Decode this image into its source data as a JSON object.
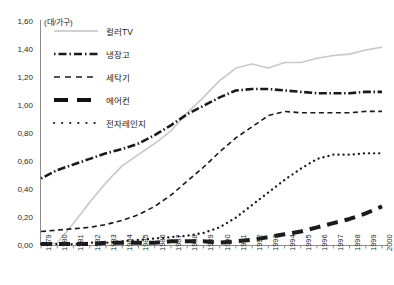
{
  "chart_data": {
    "type": "line",
    "title": "",
    "subtitle": "",
    "unit_label": "(대/가구)",
    "xlabel": "",
    "ylabel": "",
    "ylim": [
      0.0,
      1.6
    ],
    "ytick_labels": [
      "0,00",
      "0,20",
      "0,40",
      "0,60",
      "0,80",
      "1,00",
      "1,20",
      "1,40",
      "1,60"
    ],
    "ytick_values": [
      0.0,
      0.2,
      0.4,
      0.6,
      0.8,
      1.0,
      1.2,
      1.4,
      1.6
    ],
    "grid": false,
    "legend_position": "upper-left",
    "categories": [
      "1979",
      "1980",
      "1981",
      "1982",
      "1983",
      "1984",
      "1985",
      "1986",
      "1987",
      "1988",
      "1989",
      "1990",
      "1991",
      "1992",
      "1993",
      "1994",
      "1995",
      "1996",
      "1997",
      "1998",
      "1999",
      "2000"
    ],
    "series": [
      {
        "name": "컬러TV",
        "style": "solid",
        "color": "#c8c8c8",
        "values": [
          0.0,
          0.02,
          0.16,
          0.31,
          0.45,
          0.57,
          0.65,
          0.73,
          0.82,
          0.95,
          1.06,
          1.18,
          1.27,
          1.3,
          1.27,
          1.31,
          1.31,
          1.34,
          1.36,
          1.37,
          1.4,
          1.42
        ]
      },
      {
        "name": "냉장고",
        "style": "dash-dot",
        "color": "#1a1a1a",
        "values": [
          0.48,
          0.54,
          0.58,
          0.62,
          0.66,
          0.69,
          0.73,
          0.79,
          0.86,
          0.94,
          1.0,
          1.06,
          1.11,
          1.12,
          1.12,
          1.11,
          1.1,
          1.09,
          1.09,
          1.09,
          1.1,
          1.1
        ]
      },
      {
        "name": "세탁기",
        "style": "dashed",
        "color": "#1a1a1a",
        "values": [
          0.1,
          0.11,
          0.12,
          0.13,
          0.15,
          0.18,
          0.22,
          0.28,
          0.36,
          0.46,
          0.56,
          0.67,
          0.77,
          0.85,
          0.93,
          0.96,
          0.95,
          0.95,
          0.95,
          0.95,
          0.96,
          0.96
        ]
      },
      {
        "name": "에어컨",
        "style": "thick-dash",
        "color": "#1a1a1a",
        "values": [
          0.01,
          0.01,
          0.01,
          0.01,
          0.02,
          0.02,
          0.02,
          0.02,
          0.03,
          0.03,
          0.03,
          0.02,
          0.03,
          0.04,
          0.06,
          0.08,
          0.1,
          0.13,
          0.16,
          0.19,
          0.23,
          0.28
        ]
      },
      {
        "name": "전자레인지",
        "style": "dotted",
        "color": "#1a1a1a",
        "values": [
          0.01,
          0.01,
          0.01,
          0.02,
          0.02,
          0.03,
          0.04,
          0.05,
          0.06,
          0.07,
          0.09,
          0.13,
          0.2,
          0.29,
          0.38,
          0.47,
          0.55,
          0.62,
          0.65,
          0.65,
          0.66,
          0.66
        ]
      }
    ]
  },
  "legend": {
    "items": [
      {
        "label": "컬러TV"
      },
      {
        "label": "냉장고"
      },
      {
        "label": "세탁기"
      },
      {
        "label": "에어컨"
      },
      {
        "label": "전자레인지"
      }
    ]
  }
}
